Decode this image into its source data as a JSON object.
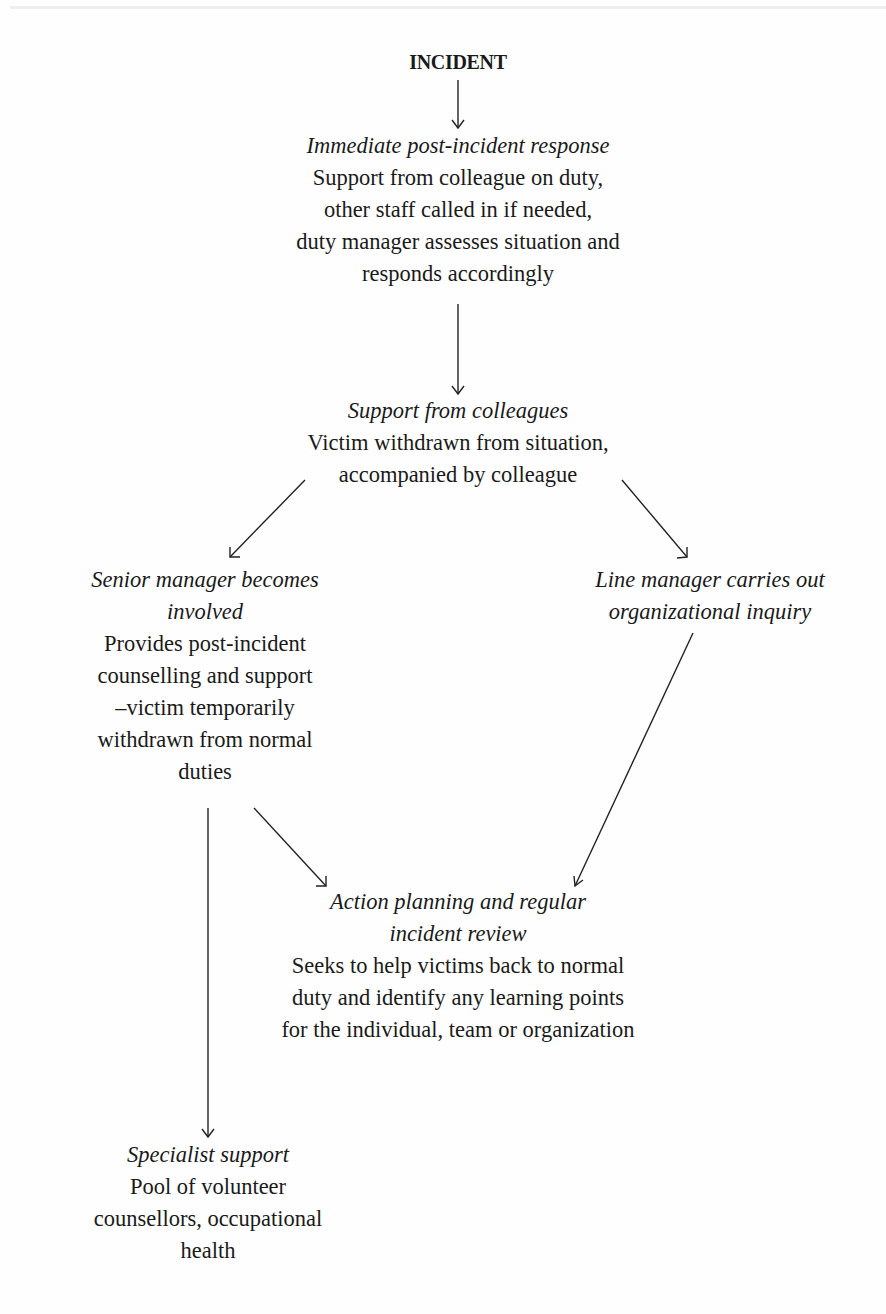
{
  "diagram": {
    "type": "flowchart",
    "nodes": {
      "incident": {
        "title": "INCIDENT"
      },
      "immediate": {
        "title": "Immediate post-incident response",
        "body_lines": [
          "Support from colleague on duty,",
          "other staff called in if needed,",
          "duty manager assesses situation and",
          "responds accordingly"
        ]
      },
      "colleagues": {
        "title": "Support from colleagues",
        "body_lines": [
          "Victim withdrawn from situation,",
          "accompanied by colleague"
        ]
      },
      "senior": {
        "title_lines": [
          "Senior manager becomes",
          "involved"
        ],
        "body_lines": [
          "Provides post-incident",
          "counselling and support",
          "–victim temporarily",
          "withdrawn from normal",
          "duties"
        ]
      },
      "line_manager": {
        "title_lines": [
          "Line manager carries out",
          "organizational inquiry"
        ]
      },
      "action": {
        "title_lines": [
          "Action planning and regular",
          "incident review"
        ],
        "body_lines": [
          "Seeks to help victims back to normal",
          "duty and identify any learning points",
          "for the individual, team or organization"
        ]
      },
      "specialist": {
        "title": "Specialist support",
        "body_lines": [
          "Pool of volunteer",
          "counsellors, occupational",
          "health"
        ]
      }
    },
    "edges": [
      {
        "from": "incident",
        "to": "immediate"
      },
      {
        "from": "immediate",
        "to": "colleagues"
      },
      {
        "from": "colleagues",
        "to": "senior"
      },
      {
        "from": "colleagues",
        "to": "line_manager"
      },
      {
        "from": "senior",
        "to": "action"
      },
      {
        "from": "line_manager",
        "to": "action"
      },
      {
        "from": "senior",
        "to": "specialist"
      }
    ]
  }
}
